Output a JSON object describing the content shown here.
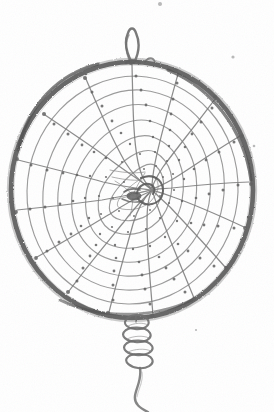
{
  "image": {
    "title": "Netted Hoop",
    "subject": "circular netted hoop with spiral mesh, top hanging loop, bottom coil binding and trailing cord",
    "medium": "pencil / ink line drawing on white paper (scanned)",
    "width_px": 274,
    "height_px": 412,
    "background_color": "#ffffff",
    "ink_color": "#6f6f6f",
    "ink_color_dark": "#5a5a5a",
    "ink_color_light": "#8a8a8a"
  },
  "geometry": {
    "hoop": {
      "label": "outer hoop ring",
      "center_x": 132,
      "center_y": 190,
      "radius_x": 121,
      "radius_y": 128,
      "stroke_width": 4.6
    },
    "hub": {
      "label": "spiral hub",
      "center_x": 148,
      "center_y": 189,
      "radius": 15
    },
    "top_loop": {
      "label": "top hanging loop",
      "apex_x": 131,
      "apex_y": 28,
      "base_x": 132,
      "base_y": 63,
      "width": 17
    },
    "coil": {
      "label": "bottom coil binding",
      "top_x": 136,
      "top_y": 316,
      "bottom_y": 372,
      "turns": 4,
      "width": 24
    },
    "tail": {
      "label": "trailing cord",
      "start_x": 140,
      "start_y": 370,
      "end_x": 150,
      "end_y": 412
    }
  },
  "mesh": {
    "label": "spiral net mesh",
    "radial_arm_count": 16,
    "concentric_ring_count": 8,
    "spiral_direction": "counter-clockwise inward",
    "spiral_turn_degrees": 78,
    "knot_count": 96,
    "cell_shape": "diamond"
  },
  "specks": [
    {
      "name": "scan-speck-top",
      "x": 160,
      "y": 4,
      "r": 2.0
    },
    {
      "name": "scan-speck-upper-right",
      "x": 233,
      "y": 57,
      "r": 1.6
    },
    {
      "name": "scan-speck-right",
      "x": 254,
      "y": 146,
      "r": 1.3
    },
    {
      "name": "scan-speck-lower-right",
      "x": 196,
      "y": 330,
      "r": 1.1
    }
  ],
  "caption": {
    "alt_text": "Hand drawn circular netted hoop with a radiating spiral web, a pointed loop at the top for hanging, a wrapped coil below the ring and a cord trailing off the bottom edge."
  }
}
